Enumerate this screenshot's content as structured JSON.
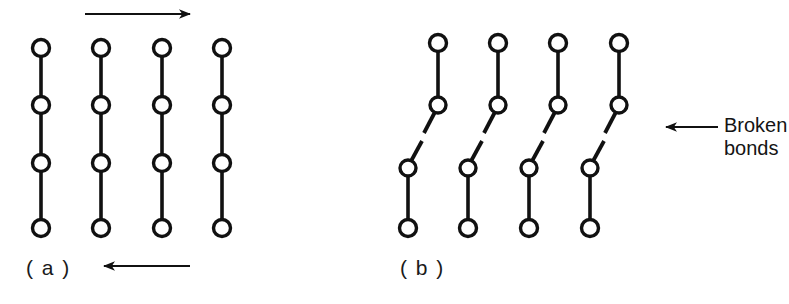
{
  "figure": {
    "type": "scientific-diagram",
    "background_color": "#ffffff",
    "ink_color": "#111111"
  },
  "panels": [
    {
      "id": "a",
      "label": "( a )",
      "label_position": {
        "x": 26,
        "y": 256
      },
      "description": "Four intact vertical molecular chains, each with four circular atoms joined by bonds, with shear arrows above and below",
      "chains": [
        {
          "x": 41,
          "atoms_y": [
            48,
            105,
            163,
            228
          ]
        },
        {
          "x": 101,
          "atoms_y": [
            48,
            105,
            163,
            228
          ]
        },
        {
          "x": 162,
          "atoms_y": [
            48,
            105,
            163,
            228
          ]
        },
        {
          "x": 222,
          "atoms_y": [
            48,
            105,
            163,
            228
          ]
        }
      ],
      "arrows": [
        {
          "name": "shear-arrow-top",
          "direction": "right",
          "x1": 85,
          "x2": 196,
          "y": 14
        },
        {
          "name": "shear-arrow-bottom",
          "direction": "left",
          "x1": 190,
          "x2": 104,
          "y": 266
        }
      ]
    },
    {
      "id": "b",
      "label": "( b )",
      "label_position": {
        "x": 400,
        "y": 256
      },
      "description": "Four upper chain fragments displaced right and four lower fragments displaced left, each terminating in an angled broken-bond stub",
      "upper_fragments": [
        {
          "x": 438,
          "atoms_y": [
            43,
            105
          ],
          "stub": "down-left"
        },
        {
          "x": 498,
          "atoms_y": [
            43,
            105
          ],
          "stub": "down-left"
        },
        {
          "x": 558,
          "atoms_y": [
            43,
            105
          ],
          "stub": "down-left"
        },
        {
          "x": 619,
          "atoms_y": [
            43,
            105
          ],
          "stub": "down-left"
        }
      ],
      "lower_fragments": [
        {
          "x": 408,
          "atoms_y": [
            168,
            228
          ],
          "stub": "up-right"
        },
        {
          "x": 468,
          "atoms_y": [
            168,
            228
          ],
          "stub": "up-right"
        },
        {
          "x": 529,
          "atoms_y": [
            168,
            228
          ],
          "stub": "up-right"
        },
        {
          "x": 590,
          "atoms_y": [
            168,
            228
          ],
          "stub": "up-right"
        }
      ],
      "annotation": {
        "name": "broken-bonds-annotation",
        "lines": [
          "Broken",
          "bonds"
        ],
        "arrow": {
          "direction": "left",
          "x1": 718,
          "x2": 654,
          "y": 127
        }
      }
    }
  ],
  "annotations": {
    "broken_bonds_line1": "Broken",
    "broken_bonds_line2": "bonds"
  },
  "labels": {
    "panel_a": "( a )",
    "panel_b": "( b )"
  },
  "style": {
    "atom_radius": 8.5,
    "atom_stroke_width": 3.4,
    "bond_stroke_width": 3.6,
    "arrow_stroke_width": 2.2
  }
}
